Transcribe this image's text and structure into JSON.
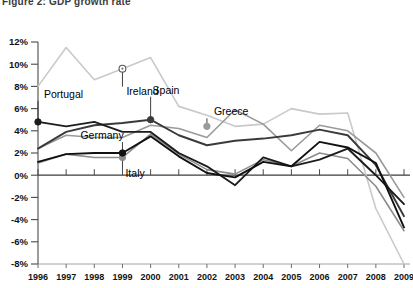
{
  "chart_data": {
    "type": "line",
    "title": "Figure 2: GDP growth rate",
    "xlabel": "",
    "ylabel": "",
    "x": [
      1996,
      1997,
      1998,
      1999,
      2000,
      2001,
      2002,
      2003,
      2004,
      2005,
      2006,
      2007,
      2008,
      2009
    ],
    "ylim": [
      -8,
      12
    ],
    "ytick_labels": [
      "12%",
      "10%",
      "8%",
      "6%",
      "4%",
      "2%",
      "0%",
      "-2%",
      "-4%",
      "-6%",
      "-8%"
    ],
    "ytick_values": [
      12,
      10,
      8,
      6,
      4,
      2,
      0,
      -2,
      -4,
      -6,
      -8
    ],
    "grid": false,
    "legend_position": "inline-labels",
    "zero_line": true,
    "series": [
      {
        "name": "Ireland",
        "color": "#c9c9c9",
        "label_year": 1999,
        "label_value": 9.6,
        "marker": "circle-open",
        "values": [
          8.0,
          11.5,
          8.6,
          9.6,
          10.6,
          6.2,
          5.4,
          4.4,
          4.6,
          6.0,
          5.5,
          5.6,
          -3.0,
          -8.0
        ]
      },
      {
        "name": "Greece",
        "color": "#9a9a9a",
        "label_year": 2002,
        "label_value": 4.4,
        "marker": "circle-filled",
        "values": [
          2.4,
          3.6,
          3.4,
          3.4,
          4.5,
          4.2,
          3.4,
          5.9,
          4.6,
          2.2,
          4.5,
          4.0,
          2.0,
          -2.0
        ]
      },
      {
        "name": "Spain",
        "color": "#3a3a3a",
        "label_year": 2000,
        "label_value": 5.0,
        "marker": "circle-filled",
        "values": [
          2.4,
          3.9,
          4.5,
          4.7,
          5.0,
          3.6,
          2.7,
          3.1,
          3.3,
          3.6,
          4.1,
          3.6,
          0.9,
          -3.7
        ]
      },
      {
        "name": "Portugal",
        "color": "#1c1c1c",
        "label_year": 1996,
        "label_value": 4.8,
        "marker": "circle-filled",
        "values": [
          4.8,
          4.4,
          4.8,
          3.9,
          3.9,
          2.0,
          0.8,
          -0.9,
          1.6,
          0.8,
          1.4,
          2.4,
          0.0,
          -2.6
        ]
      },
      {
        "name": "Italy",
        "color": "#8d8d8d",
        "label_year": 1999,
        "label_value": 1.6,
        "marker": "circle-filled",
        "values": [
          1.1,
          1.9,
          1.6,
          1.6,
          3.7,
          1.9,
          0.5,
          0.1,
          1.4,
          0.8,
          2.0,
          1.5,
          -1.0,
          -5.0
        ]
      },
      {
        "name": "Germany",
        "color": "#111111",
        "label_year": 1999,
        "label_value": 2.0,
        "marker": "circle-filled",
        "values": [
          1.2,
          1.9,
          2.0,
          2.0,
          3.5,
          1.7,
          0.2,
          -0.2,
          1.2,
          0.8,
          3.0,
          2.5,
          1.1,
          -4.7
        ]
      }
    ],
    "annotations": [
      {
        "text": "Ireland",
        "x": 1999,
        "y": 9.6,
        "dx": 4,
        "dy": 26
      },
      {
        "text": "Greece",
        "x": 2002,
        "y": 4.4,
        "dx": 7,
        "dy": -11
      },
      {
        "text": "Spain",
        "x": 2000,
        "y": 5.0,
        "dx": 2,
        "dy": -26
      },
      {
        "text": "Portugal",
        "x": 1996,
        "y": 4.8,
        "dx": 6,
        "dy": -24
      },
      {
        "text": "Italy",
        "x": 1999,
        "y": 1.6,
        "dx": 3,
        "dy": 20
      },
      {
        "text": "Germany",
        "x": 1999,
        "y": 2.0,
        "dx": -42,
        "dy": -14
      }
    ]
  },
  "axes": {
    "plot_left": 38,
    "plot_right": 404,
    "plot_top": 42,
    "plot_bottom": 264,
    "zero_y": 175
  }
}
